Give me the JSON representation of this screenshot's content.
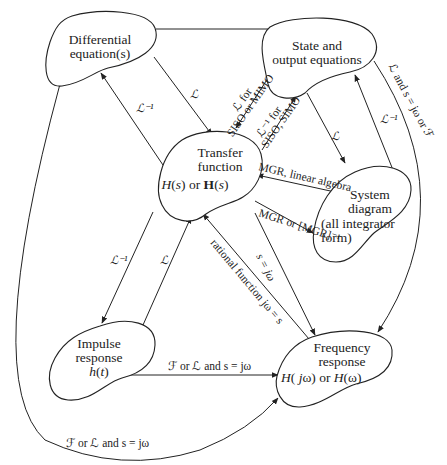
{
  "nodes": {
    "differential": {
      "line1": "Differential",
      "line2": "equation(s)"
    },
    "state": {
      "line1": "State and",
      "line2": "output equations"
    },
    "transfer": {
      "line1": "Transfer",
      "line2": "function",
      "line3": "H(s) or H(s)"
    },
    "system": {
      "line1": "System",
      "line2": "diagram",
      "line3": "(all integrator",
      "line4": "form)"
    },
    "impulse": {
      "line1": "Impulse",
      "line2": "response",
      "line3": "h(t)"
    },
    "frequency": {
      "line1": "Frequency",
      "line2": "response",
      "line3": "H(jω) or H(ω)"
    }
  },
  "edges": {
    "diff_to_tf": "ℒ",
    "tf_to_diff": "ℒ⁻¹",
    "state_to_tf_1": "ℒ for",
    "state_to_tf_2": "SISO or MIMO",
    "tf_to_state_1": "ℒ⁻¹ for",
    "tf_to_state_2": "SISO, SIMO",
    "state_to_sys": "ℒ",
    "sys_to_state": "ℒ⁻¹",
    "state_to_freq": "ℒ and s = jω or ℱ",
    "sys_to_tf": "MGR, linear algebra",
    "tf_to_sys": "MGR or [MGR]⁻¹",
    "tf_to_freq": "s = jω",
    "freq_to_tf": "rational function jω = s",
    "tf_to_imp": "ℒ⁻¹",
    "imp_to_tf": "ℒ",
    "imp_to_freq": "ℱ or ℒ and s = jω",
    "diff_to_freq": "ℱ or ℒ and s = jω"
  }
}
